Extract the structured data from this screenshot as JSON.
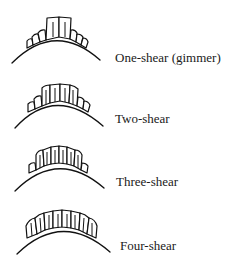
{
  "diagram": {
    "type": "sheep-dentition-age-stages",
    "stages": [
      {
        "label": "One-shear (gimmer)",
        "permanent_incisor_pairs": 1
      },
      {
        "label": "Two-shear",
        "permanent_incisor_pairs": 2
      },
      {
        "label": "Three-shear",
        "permanent_incisor_pairs": 3
      },
      {
        "label": "Four-shear",
        "permanent_incisor_pairs": 4
      }
    ],
    "colors": {
      "line": "#111111",
      "background": "#ffffff",
      "text": "#1a1a1a"
    }
  }
}
